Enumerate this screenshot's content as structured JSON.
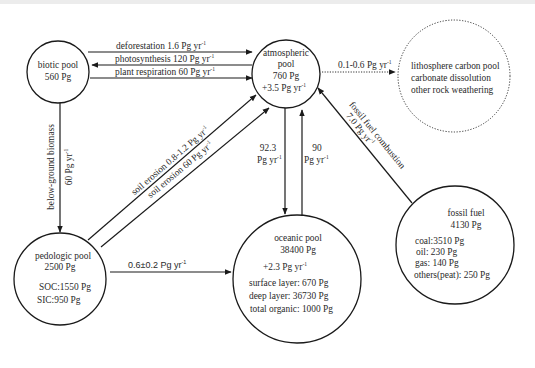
{
  "diagram": {
    "type": "carbon-cycle-flow-diagram",
    "pools": {
      "biotic": {
        "name": "biotic pool",
        "size": "560 Pg"
      },
      "atmospheric": {
        "name_line1": "atmospheric",
        "name_line2": "pool",
        "size": "760 Pg",
        "change": "+3.5 Pg yr",
        "change_sup": "-1"
      },
      "lithosphere": {
        "line1": "lithosphere carbon pool",
        "line2": "carbonate dissolution",
        "line3": "other rock weathering"
      },
      "pedologic": {
        "name": "pedologic pool",
        "size": "2500 Pg",
        "soc": "SOC:1550 Pg",
        "sic": "SIC:950 Pg"
      },
      "oceanic": {
        "name": "oceanic pool",
        "size": "38400 Pg",
        "change": "+2.3 Pg yr",
        "change_sup": "-1",
        "surface": "surface layer: 670 Pg",
        "deep": "deep layer: 36730 Pg",
        "organic": "total organic: 1000 Pg"
      },
      "fossil": {
        "name": "fossil fuel",
        "size": "4130 Pg",
        "coal": "coal:3510 Pg",
        "oil": "oil: 230 Pg",
        "gas": "gas: 140 Pg",
        "others": "others(peat): 250 Pg"
      }
    },
    "fluxes": {
      "deforestation": {
        "label": "deforestation 1.6 Pg yr",
        "sup": "-1",
        "from": "biotic",
        "to": "atmospheric"
      },
      "photosynthesis": {
        "label": "photosynthesis 120 Pg yr",
        "sup": "-1",
        "from": "atmospheric",
        "to": "biotic"
      },
      "plant_respiration": {
        "label": "plant respiration 60 Pg yr",
        "sup": "-1",
        "from": "biotic",
        "to": "atmospheric"
      },
      "lithosphere_flux": {
        "label": "0.1-0.6 Pg yr",
        "sup": "-1",
        "from": "atmospheric",
        "to": "lithosphere",
        "style": "dotted"
      },
      "below_ground": {
        "label1": "below-ground biomass",
        "label2": "60 Pg yr",
        "sup": "-1",
        "from": "biotic",
        "to": "pedologic"
      },
      "soil_erosion_1": {
        "label": "soil erosion 0.8-1.2 Pg yr",
        "sup": "-1",
        "from": "pedologic",
        "to": "atmospheric"
      },
      "soil_erosion_2": {
        "label": "soil erosion 60 Pg yr",
        "sup": "-1",
        "from": "pedologic",
        "to": "atmospheric"
      },
      "ocean_uptake": {
        "value": "92.3",
        "unit": "Pg yr",
        "sup": "-1",
        "from": "atmospheric",
        "to": "oceanic"
      },
      "ocean_release": {
        "value": "90",
        "unit": "Pg yr",
        "sup": "-1",
        "from": "oceanic",
        "to": "atmospheric"
      },
      "pedologic_to_ocean": {
        "label": "0.6±0.2 Pg yr",
        "sup": "-1",
        "from": "pedologic",
        "to": "oceanic"
      },
      "fossil_combustion": {
        "label1": "fossil fuel combustion",
        "label2": "7.0 Pg yr",
        "sup": "-1",
        "from": "fossil",
        "to": "atmospheric"
      }
    }
  }
}
